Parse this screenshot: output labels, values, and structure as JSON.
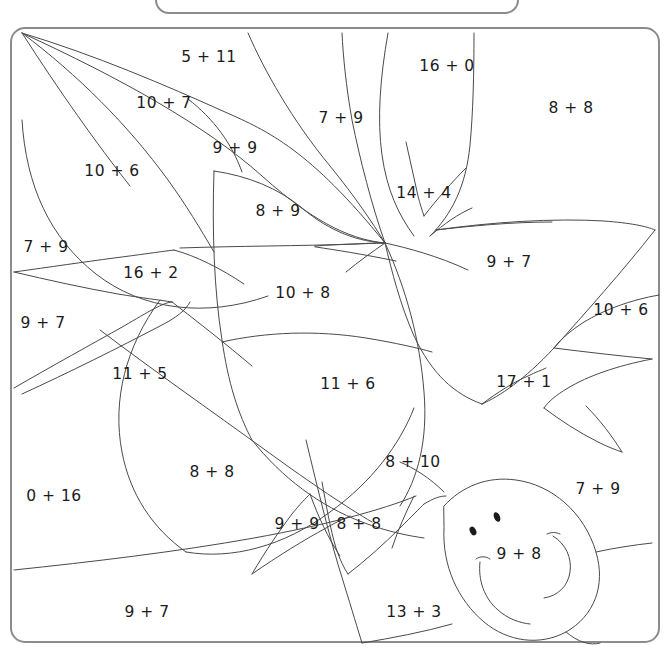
{
  "page": {
    "width": 670,
    "height": 654,
    "background": "#ffffff",
    "ink_color": "#3a3a3a",
    "text_color": "#1b1b1b",
    "frame_color": "#8c8c8e"
  },
  "header": {
    "visible_fragment": "",
    "note": "top rounded box is cropped off-screen; only its bottom edge and a faint descender are visible"
  },
  "worksheet": {
    "title": "Color by sum picture puzzle",
    "type": "color-by-number",
    "frame": {
      "x": 10,
      "y": 27,
      "width": 650,
      "height": 616,
      "radius": 14,
      "stroke": "#8c8c8e",
      "stroke_width": 2
    },
    "regions": [
      {
        "id": "r01",
        "label": "5 + 11",
        "x": 209,
        "y": 57,
        "a": 5,
        "b": 11,
        "sum": 16
      },
      {
        "id": "r02",
        "label": "10 + 7",
        "x": 164,
        "y": 103,
        "a": 10,
        "b": 7,
        "sum": 17
      },
      {
        "id": "r03",
        "label": "16 + 0",
        "x": 447,
        "y": 66,
        "a": 16,
        "b": 0,
        "sum": 16
      },
      {
        "id": "r04",
        "label": "8 + 8",
        "x": 571,
        "y": 108,
        "a": 8,
        "b": 8,
        "sum": 16
      },
      {
        "id": "r05",
        "label": "7 + 9",
        "x": 341,
        "y": 118,
        "a": 7,
        "b": 9,
        "sum": 16
      },
      {
        "id": "r06",
        "label": "9 + 9",
        "x": 235,
        "y": 148,
        "a": 9,
        "b": 9,
        "sum": 18
      },
      {
        "id": "r07",
        "label": "10 + 6",
        "x": 112,
        "y": 171,
        "a": 10,
        "b": 6,
        "sum": 16
      },
      {
        "id": "r08",
        "label": "14 + 4",
        "x": 424,
        "y": 193,
        "a": 14,
        "b": 4,
        "sum": 18
      },
      {
        "id": "r09",
        "label": "8 + 9",
        "x": 278,
        "y": 211,
        "a": 8,
        "b": 9,
        "sum": 17
      },
      {
        "id": "r10",
        "label": "9 + 7",
        "x": 509,
        "y": 262,
        "a": 9,
        "b": 7,
        "sum": 16
      },
      {
        "id": "r11",
        "label": "7 + 9",
        "x": 46,
        "y": 247,
        "a": 7,
        "b": 9,
        "sum": 16
      },
      {
        "id": "r12",
        "label": "16 + 2",
        "x": 151,
        "y": 273,
        "a": 16,
        "b": 2,
        "sum": 18
      },
      {
        "id": "r13",
        "label": "10 + 8",
        "x": 303,
        "y": 293,
        "a": 10,
        "b": 8,
        "sum": 18
      },
      {
        "id": "r14",
        "label": "10 + 6",
        "x": 621,
        "y": 310,
        "a": 10,
        "b": 6,
        "sum": 16
      },
      {
        "id": "r15",
        "label": "9 + 7",
        "x": 43,
        "y": 323,
        "a": 9,
        "b": 7,
        "sum": 16
      },
      {
        "id": "r16",
        "label": "11 + 5",
        "x": 140,
        "y": 374,
        "a": 11,
        "b": 5,
        "sum": 16
      },
      {
        "id": "r17",
        "label": "11 + 6",
        "x": 348,
        "y": 384,
        "a": 11,
        "b": 6,
        "sum": 17
      },
      {
        "id": "r18",
        "label": "17 + 1",
        "x": 524,
        "y": 382,
        "a": 17,
        "b": 1,
        "sum": 18
      },
      {
        "id": "r19",
        "label": "8 + 10",
        "x": 413,
        "y": 462,
        "a": 8,
        "b": 10,
        "sum": 18
      },
      {
        "id": "r20",
        "label": "8 + 8",
        "x": 212,
        "y": 472,
        "a": 8,
        "b": 8,
        "sum": 16
      },
      {
        "id": "r21",
        "label": "7 + 9",
        "x": 598,
        "y": 489,
        "a": 7,
        "b": 9,
        "sum": 16
      },
      {
        "id": "r22",
        "label": "0 + 16",
        "x": 54,
        "y": 496,
        "a": 0,
        "b": 16,
        "sum": 16
      },
      {
        "id": "r23",
        "label": "9 + 9",
        "x": 297,
        "y": 524,
        "a": 9,
        "b": 9,
        "sum": 18
      },
      {
        "id": "r24",
        "label": "8 + 8",
        "x": 359,
        "y": 524,
        "a": 8,
        "b": 8,
        "sum": 16
      },
      {
        "id": "r25",
        "label": "9 + 8",
        "x": 519,
        "y": 554,
        "a": 9,
        "b": 8,
        "sum": 17
      },
      {
        "id": "r26",
        "label": "9 + 7",
        "x": 147,
        "y": 612,
        "a": 9,
        "b": 7,
        "sum": 16
      },
      {
        "id": "r27",
        "label": "13 + 3",
        "x": 414,
        "y": 612,
        "a": 13,
        "b": 3,
        "sum": 16
      }
    ]
  }
}
